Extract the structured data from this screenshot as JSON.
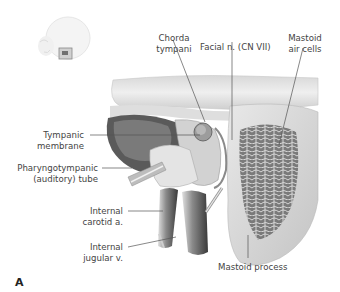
{
  "figure": {
    "panel_letter": "A",
    "labels": {
      "chorda_tympani": [
        "Chorda",
        "tympani"
      ],
      "facial_nerve": "Facial n. (CN VII)",
      "mastoid_air_cells": [
        "Mastoid",
        "air cells"
      ],
      "tympanic_membrane": [
        "Tympanic",
        "membrane"
      ],
      "pharyngotympanic_tube": [
        "Pharyngotympanic",
        "(auditory) tube"
      ],
      "internal_carotid": [
        "Internal",
        "carotid a."
      ],
      "internal_jugular": [
        "Internal",
        "jugular v."
      ],
      "mastoid_process": "Mastoid process"
    },
    "colors": {
      "leader_line": "#555555",
      "bone_light": "#e6e6e6",
      "bone_mid": "#bdbdbd",
      "bone_dark": "#6e6e6e",
      "background": "#ffffff"
    }
  }
}
